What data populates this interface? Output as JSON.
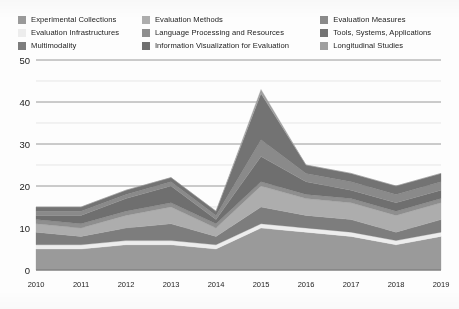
{
  "legend": {
    "columns": [
      {
        "items": [
          {
            "label": "Experimental Collections",
            "color": "#9a9a9a"
          },
          {
            "label": "Evaluation Infrastructures",
            "color": "#ededed"
          },
          {
            "label": "Multimodality",
            "color": "#7d7d7d"
          }
        ]
      },
      {
        "items": [
          {
            "label": "Evaluation Methods",
            "color": "#adadad"
          },
          {
            "label": "Language Processing and Resources",
            "color": "#8e8e8e"
          },
          {
            "label": "Information Visualization for Evaluation",
            "color": "#6f6f6f"
          }
        ]
      },
      {
        "items": [
          {
            "label": "Evaluation Measures",
            "color": "#8a8a8a"
          },
          {
            "label": "Tools, Systems, Applications",
            "color": "#737373"
          },
          {
            "label": "Longitudinal Studies",
            "color": "#9f9f9f"
          }
        ]
      }
    ]
  },
  "axes": {
    "y_ticks": [
      "0",
      "10",
      "20",
      "30",
      "40",
      "50"
    ],
    "y_tick_values": [
      0,
      10,
      20,
      30,
      40,
      50
    ],
    "x_ticks": [
      "2010",
      "2011",
      "2012",
      "2013",
      "2014",
      "2015",
      "2016",
      "2017",
      "2018",
      "2019"
    ]
  },
  "chart_data": {
    "type": "area",
    "title": "",
    "xlabel": "",
    "ylabel": "",
    "ylim": [
      0,
      50
    ],
    "grid": true,
    "stacked": true,
    "legend_position": "top",
    "categories": [
      "2010",
      "2011",
      "2012",
      "2013",
      "2014",
      "2015",
      "2016",
      "2017",
      "2018",
      "2019"
    ],
    "series": [
      {
        "name": "Experimental Collections",
        "color": "#9a9a9a",
        "values": [
          5,
          5,
          6,
          6,
          5,
          10,
          9,
          8,
          6,
          8
        ]
      },
      {
        "name": "Evaluation Infrastructures",
        "color": "#ededed",
        "values": [
          1,
          1,
          1,
          1,
          1,
          1,
          1,
          1,
          1,
          1
        ]
      },
      {
        "name": "Multimodality",
        "color": "#7d7d7d",
        "values": [
          3,
          2,
          3,
          4,
          2,
          4,
          3,
          3,
          2,
          3
        ]
      },
      {
        "name": "Evaluation Methods",
        "color": "#adadad",
        "values": [
          2,
          2,
          3,
          4,
          2,
          5,
          4,
          4,
          4,
          4
        ]
      },
      {
        "name": "Language Processing and Resources",
        "color": "#8e8e8e",
        "values": [
          1,
          1,
          1,
          1,
          1,
          1,
          1,
          1,
          1,
          1
        ]
      },
      {
        "name": "Information Visualization for Evaluation",
        "color": "#6f6f6f",
        "values": [
          1,
          2,
          3,
          4,
          1,
          6,
          3,
          2,
          2,
          2
        ]
      },
      {
        "name": "Evaluation Measures",
        "color": "#8a8a8a",
        "values": [
          1,
          1,
          1,
          1,
          1,
          4,
          2,
          2,
          2,
          2
        ]
      },
      {
        "name": "Tools, Systems, Applications",
        "color": "#737373",
        "values": [
          1,
          1,
          1,
          1,
          1,
          11,
          2,
          2,
          2,
          2
        ]
      },
      {
        "name": "Longitudinal Studies",
        "color": "#9f9f9f",
        "values": [
          0,
          0,
          0,
          0,
          0,
          1,
          0,
          0,
          0,
          0
        ]
      }
    ],
    "totals": [
      15,
      15,
      19,
      22,
      14,
      43,
      25,
      23,
      20,
      23
    ]
  }
}
